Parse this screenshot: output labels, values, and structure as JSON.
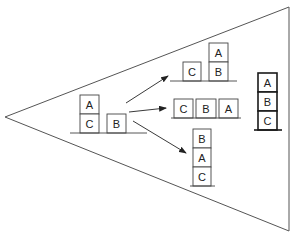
{
  "diagram": {
    "type": "blocks-world-search",
    "colors": {
      "line": "#3a3a3a",
      "goal_line": "#1a1a1a",
      "background": "#ffffff"
    },
    "initial_state": {
      "stacks": [
        [
          "C",
          "A"
        ],
        [
          "B"
        ]
      ],
      "blocks": {
        "a": "A",
        "c": "C",
        "b": "B"
      }
    },
    "successors": [
      {
        "id": "top",
        "stacks": [
          [
            "C"
          ],
          [
            "B",
            "A"
          ]
        ],
        "blocks": {
          "c": "C",
          "b": "B",
          "a": "A"
        }
      },
      {
        "id": "middle",
        "stacks": [
          [
            "C"
          ],
          [
            "B"
          ],
          [
            "A"
          ]
        ],
        "blocks": {
          "c": "C",
          "b": "B",
          "a": "A"
        }
      },
      {
        "id": "bottom",
        "stacks": [
          [
            "C",
            "A",
            "B"
          ]
        ],
        "blocks": {
          "b": "B",
          "a": "A",
          "c": "C"
        }
      }
    ],
    "goal_state": {
      "stacks": [
        [
          "C",
          "B",
          "A"
        ]
      ],
      "blocks": {
        "a": "A",
        "b": "B",
        "c": "C"
      }
    },
    "arrows": [
      "initial-to-top",
      "initial-to-middle",
      "initial-to-bottom"
    ]
  }
}
